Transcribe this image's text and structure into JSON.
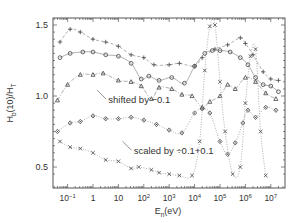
{
  "chart_data": {
    "type": "scatter",
    "title": "",
    "xlabel": "E_n(eV)",
    "xlabel_main": "E",
    "xlabel_sub": "n",
    "xlabel_unit": "(eV)",
    "ylabel": "H_b(10)/H_T",
    "ylabel_main": "H",
    "ylabel_sub": "b",
    "ylabel_rest": "(10)/H",
    "ylabel_sub2": "T",
    "x_scale": "log",
    "xlim": [
      0.03,
      30000000
    ],
    "ylim": [
      0.42,
      1.56
    ],
    "grid": false,
    "legend": "none",
    "x_ticks": [
      {
        "exp": -1,
        "label": "10",
        "sup": "−1"
      },
      {
        "exp": 0,
        "label": "1",
        "sup": ""
      },
      {
        "exp": 1,
        "label": "10",
        "sup": ""
      },
      {
        "exp": 2,
        "label": "10",
        "sup": "2"
      },
      {
        "exp": 3,
        "label": "10",
        "sup": "3"
      },
      {
        "exp": 4,
        "label": "10",
        "sup": "4"
      },
      {
        "exp": 5,
        "label": "10",
        "sup": "5"
      },
      {
        "exp": 6,
        "label": "10",
        "sup": "6"
      },
      {
        "exp": 7,
        "label": "10",
        "sup": "7"
      }
    ],
    "y_ticks": [
      {
        "value": 0.5,
        "label": "0.5"
      },
      {
        "value": 1.0,
        "label": "1.0"
      },
      {
        "value": 1.5,
        "label": "1.5"
      }
    ],
    "annotations": [
      {
        "text": "shifted by −0.1",
        "x_log": 0.6,
        "y": 0.97
      },
      {
        "text": "scaled by ÷0.1+0.1",
        "x_log": 1.6,
        "y": 0.61
      }
    ],
    "series": [
      {
        "name": "plus",
        "marker": "+",
        "line": "dashed",
        "points": [
          [
            -1.3,
            1.38
          ],
          [
            -0.9,
            1.47
          ],
          [
            -0.5,
            1.45
          ],
          [
            0.0,
            1.4
          ],
          [
            0.5,
            1.38
          ],
          [
            1.0,
            1.35
          ],
          [
            1.5,
            1.29
          ],
          [
            2.0,
            1.27
          ],
          [
            2.4,
            1.22
          ],
          [
            3.0,
            1.22
          ],
          [
            3.4,
            1.23
          ],
          [
            4.0,
            1.21
          ],
          [
            4.3,
            1.27
          ],
          [
            4.8,
            1.33
          ],
          [
            5.3,
            1.36
          ],
          [
            5.8,
            1.41
          ],
          [
            6.0,
            1.37
          ],
          [
            6.3,
            1.29
          ],
          [
            6.7,
            1.17
          ],
          [
            7.0,
            1.12
          ],
          [
            7.3,
            1.11
          ]
        ]
      },
      {
        "name": "circle",
        "marker": "o",
        "line": "solid",
        "points": [
          [
            -1.3,
            1.27
          ],
          [
            -0.9,
            1.3
          ],
          [
            -0.4,
            1.31
          ],
          [
            0.0,
            1.31
          ],
          [
            0.5,
            1.29
          ],
          [
            1.0,
            1.28
          ],
          [
            1.5,
            1.23
          ],
          [
            1.9,
            1.12
          ],
          [
            2.2,
            1.14
          ],
          [
            2.6,
            1.11
          ],
          [
            3.1,
            1.13
          ],
          [
            3.6,
            1.09
          ],
          [
            4.0,
            1.21
          ],
          [
            4.4,
            1.3
          ],
          [
            4.7,
            1.32
          ],
          [
            5.0,
            1.32
          ],
          [
            5.4,
            1.31
          ],
          [
            5.8,
            1.27
          ],
          [
            6.1,
            1.22
          ],
          [
            6.4,
            1.13
          ],
          [
            6.7,
            1.08
          ],
          [
            7.0,
            1.07
          ],
          [
            7.3,
            1.03
          ]
        ]
      },
      {
        "name": "triangle",
        "marker": "triangle",
        "line": "dashdot",
        "note": "shifted by -0.1",
        "points": [
          [
            -1.4,
            0.97
          ],
          [
            -1.0,
            1.08
          ],
          [
            -0.5,
            1.15
          ],
          [
            0.0,
            1.15
          ],
          [
            0.4,
            1.16
          ],
          [
            1.0,
            1.11
          ],
          [
            1.5,
            1.1
          ],
          [
            1.9,
            1.07
          ],
          [
            2.3,
            0.98
          ],
          [
            2.6,
            1.06
          ],
          [
            3.1,
            1.05
          ],
          [
            3.5,
            1.01
          ],
          [
            3.9,
            1.0
          ],
          [
            4.3,
            0.92
          ],
          [
            4.6,
            0.96
          ],
          [
            5.0,
            1.0
          ],
          [
            5.3,
            1.08
          ],
          [
            5.6,
            1.05
          ],
          [
            6.0,
            1.13
          ],
          [
            6.4,
            1.1
          ],
          [
            6.8,
            1.02
          ],
          [
            7.2,
            0.98
          ]
        ]
      },
      {
        "name": "diamond",
        "marker": "diamond",
        "line": "dotted",
        "points": [
          [
            -1.4,
            0.75
          ],
          [
            -0.9,
            0.81
          ],
          [
            -0.5,
            0.82
          ],
          [
            0.0,
            0.86
          ],
          [
            0.5,
            0.84
          ],
          [
            1.0,
            0.84
          ],
          [
            1.5,
            0.85
          ],
          [
            2.0,
            0.83
          ],
          [
            2.5,
            0.8
          ],
          [
            3.0,
            0.76
          ],
          [
            3.5,
            0.74
          ],
          [
            4.0,
            0.88
          ],
          [
            4.3,
            0.91
          ],
          [
            4.6,
            0.88
          ],
          [
            5.0,
            0.68
          ],
          [
            5.3,
            0.59
          ],
          [
            5.6,
            0.67
          ],
          [
            5.9,
            0.81
          ],
          [
            6.1,
            0.9
          ],
          [
            6.4,
            0.85
          ],
          [
            6.8,
            0.92
          ],
          [
            7.2,
            0.9
          ]
        ]
      },
      {
        "name": "cross",
        "marker": "x",
        "line": "dotted",
        "note": "scaled by ÷0.1+0.1",
        "points": [
          [
            -1.3,
            0.68
          ],
          [
            -0.9,
            0.64
          ],
          [
            -0.5,
            0.63
          ],
          [
            0.0,
            0.6
          ],
          [
            0.5,
            0.55
          ],
          [
            1.0,
            0.54
          ],
          [
            1.5,
            0.49
          ],
          [
            1.8,
            0.5
          ],
          [
            2.3,
            0.48
          ],
          [
            2.6,
            0.46
          ],
          [
            3.0,
            0.45
          ],
          [
            3.4,
            0.44
          ],
          [
            3.9,
            0.44
          ],
          [
            4.2,
            0.68
          ],
          [
            4.4,
            1.18
          ],
          [
            4.6,
            1.49
          ],
          [
            4.8,
            1.5
          ],
          [
            5.0,
            1.1
          ],
          [
            5.2,
            0.75
          ],
          [
            5.5,
            0.45
          ],
          [
            5.8,
            0.5
          ],
          [
            6.0,
            0.95
          ],
          [
            6.2,
            1.28
          ],
          [
            6.4,
            1.33
          ],
          [
            6.6,
            0.75
          ],
          [
            6.8,
            0.44
          ]
        ]
      }
    ]
  }
}
